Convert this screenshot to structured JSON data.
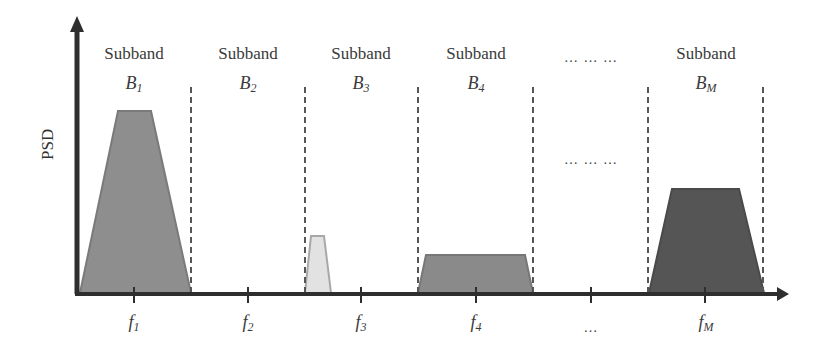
{
  "diagram": {
    "y_axis_label": "PSD",
    "x_axis_label": "",
    "subbands": [
      {
        "title": "Subband",
        "symbol": "B",
        "subscript": "1",
        "center_x": 133,
        "freq_label": "f",
        "freq_sub": "1",
        "occupied": true,
        "shade": "#8e8e8e",
        "height": "tall"
      },
      {
        "title": "Subband",
        "symbol": "B",
        "subscript": "2",
        "center_x": 248,
        "freq_label": "f",
        "freq_sub": "2",
        "occupied": false
      },
      {
        "title": "Subband",
        "symbol": "B",
        "subscript": "3",
        "center_x": 362,
        "freq_label": "f",
        "freq_sub": "3",
        "occupied": true,
        "shade": "#d9d9d9",
        "height": "narrow-short"
      },
      {
        "title": "Subband",
        "symbol": "B",
        "subscript": "4",
        "center_x": 476,
        "freq_label": "f",
        "freq_sub": "4",
        "occupied": true,
        "shade": "#8a8a8a",
        "height": "low-wide"
      },
      {
        "title": "Subband",
        "symbol": "B",
        "subscript": "M",
        "center_x": 706,
        "freq_label": "f",
        "freq_sub": "M",
        "occupied": true,
        "shade": "#555555",
        "height": "medium"
      }
    ],
    "ellipsis_top": "… … …",
    "ellipsis_mid": "… … …",
    "ellipsis_freq": "…",
    "colors": {
      "axis": "#2e2e2e",
      "divider": "#555555",
      "text": "#3a3a3a"
    }
  }
}
